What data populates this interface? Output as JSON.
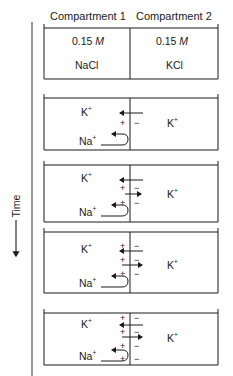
{
  "header": {
    "compartment1": "Compartment 1",
    "compartment2": "Compartment 2"
  },
  "initial": {
    "c1_concentration": "0.15",
    "c1_unit": "M",
    "c1_solute": "NaCl",
    "c2_concentration": "0.15",
    "c2_unit": "M",
    "c2_solute": "KCl"
  },
  "time_axis": {
    "label": "Time"
  },
  "ions": {
    "k": "K",
    "na": "Na",
    "charge": "+"
  },
  "panels": [
    {
      "step": 1,
      "plus_signs": 1,
      "minus_signs": 1,
      "k_arrows": [
        "left"
      ],
      "na_arrow": "reflected"
    },
    {
      "step": 2,
      "plus_signs": 2,
      "minus_signs": 2,
      "k_arrows": [
        "left",
        "right"
      ],
      "na_arrow": "reflected"
    },
    {
      "step": 3,
      "plus_signs": 3,
      "minus_signs": 3,
      "k_arrows": [
        "left",
        "right"
      ],
      "na_arrow": "reflected"
    },
    {
      "step": 4,
      "plus_signs": 4,
      "minus_signs": 4,
      "k_arrows": [
        "left",
        "right"
      ],
      "na_arrow": "reflected"
    }
  ],
  "colors": {
    "line": "#1a1a1a",
    "axis": "#555555"
  }
}
